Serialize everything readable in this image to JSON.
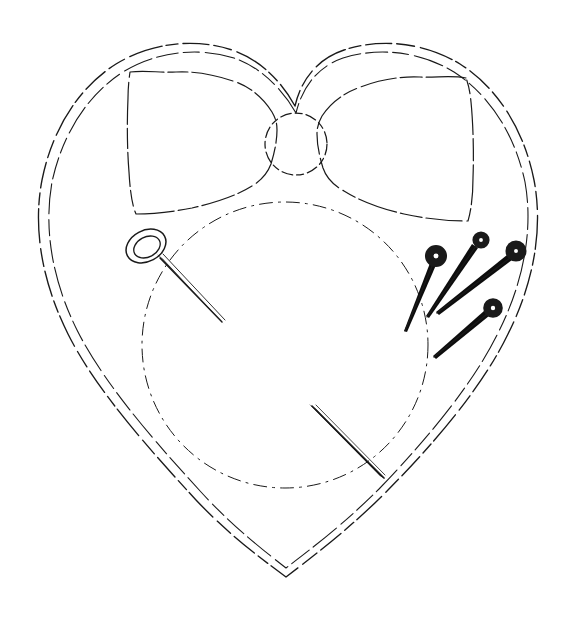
{
  "canvas": {
    "width": 575,
    "height": 620,
    "background_color": "#ffffff",
    "ink_color": "#1a1a1a",
    "pin_head_color": "#0d0d0d",
    "style": "hand-drawn pencil line sketch, dashed and broken contour lines, no shading, no text"
  },
  "artwork": {
    "title": "Heart-shaped pincushion with bow, needle and pins",
    "medium": "line drawing",
    "text_content_present": false
  },
  "objects": {
    "heart": {
      "name": "heart-outline",
      "description": "Large heart silhouette drawn with a doubled (two parallel) broken contour line",
      "line_style": "double broken line",
      "top_notch": [
        295,
        106
      ],
      "bottom_point": [
        286,
        577
      ],
      "left_extreme": [
        36,
        205
      ],
      "right_extreme": [
        540,
        205
      ],
      "left_lobe_top": [
        150,
        48
      ],
      "right_lobe_top": [
        430,
        48
      ],
      "outer_offset_px": 6
    },
    "bow": {
      "name": "bow",
      "description": "Fabric bow across the upper part of the heart with a round central knot and two wings",
      "line_style": "dashed wavy line",
      "knot": {
        "center": [
          296,
          144
        ],
        "radius": 31
      },
      "left_wing": {
        "top_left": [
          128,
          70
        ],
        "bottom_left": [
          133,
          212
        ],
        "inner_top": [
          272,
          124
        ],
        "inner_bottom": [
          272,
          170
        ]
      },
      "right_wing": {
        "top_right": [
          468,
          76
        ],
        "bottom_right": [
          472,
          220
        ],
        "inner_top": [
          320,
          124
        ],
        "inner_bottom": [
          320,
          170
        ]
      }
    },
    "inner_circle": {
      "name": "inner-dashed-circle",
      "description": "Large dash-dot circle describing the stuffed cushion face beneath the bow",
      "line_style": "dash-dot",
      "center": [
        285,
        345
      ],
      "radius": 143
    },
    "needle": {
      "name": "sewing-needle",
      "description": "Sewing needle with an oval eye at upper-left and a tapering point toward lower-right",
      "eye": {
        "center": [
          146,
          246
        ],
        "rx": 20,
        "ry": 15,
        "rotation_deg": -28
      },
      "shaft_start": [
        160,
        258
      ],
      "shaft_tip": [
        222,
        322
      ]
    },
    "loose_needle": {
      "name": "loose-needle-lower",
      "description": "Second needle lying across the lower right of the cushion, thick at upper-left, tapering to a point at lower-right",
      "start": [
        312,
        406
      ],
      "tip": [
        384,
        478
      ]
    },
    "pins": [
      {
        "name": "pin-1",
        "head": {
          "center": [
            436,
            256
          ],
          "outer_radius": 9,
          "inner_radius": 4.5
        },
        "shaft_start": [
          433,
          264
        ],
        "shaft_tip": [
          405,
          331
        ]
      },
      {
        "name": "pin-2",
        "head": {
          "center": [
            481,
            240
          ],
          "outer_radius": 7,
          "inner_radius": 3.5
        },
        "shaft_start": [
          476,
          246
        ],
        "shaft_tip": [
          427,
          317
        ]
      },
      {
        "name": "pin-3",
        "head": {
          "center": [
            516,
            251
          ],
          "outer_radius": 8.5,
          "inner_radius": 4
        },
        "shaft_start": [
          510,
          258
        ],
        "shaft_tip": [
          437,
          313
        ]
      },
      {
        "name": "pin-4",
        "head": {
          "center": [
            493,
            308
          ],
          "outer_radius": 8,
          "inner_radius": 4
        },
        "shaft_start": [
          487,
          314
        ],
        "shaft_tip": [
          434,
          357
        ]
      }
    ]
  }
}
